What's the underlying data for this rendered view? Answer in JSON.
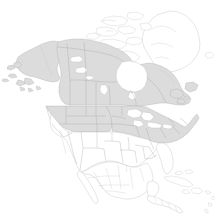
{
  "figure": {
    "kind": "choropleth-map",
    "width": 216,
    "height": 216,
    "background_color": "#ffffff"
  },
  "legend": {
    "filled_label": "Shaded region",
    "empty_label": "Unshaded region",
    "filled_color": "#dcdcdc",
    "empty_color": "#ffffff",
    "border_color": "#a9a9a9"
  },
  "map_data": {
    "projection": "lambert-conformal-conic",
    "extent": "North America, Greenland, Central America, Caribbean",
    "shaded_regions": [
      "Alaska",
      "Yukon",
      "Northwest Territories",
      "Nunavut",
      "British Columbia",
      "Alberta",
      "Saskatchewan",
      "Manitoba",
      "Ontario",
      "Quebec",
      "Newfoundland and Labrador",
      "New Brunswick",
      "Nova Scotia",
      "Prince Edward Island",
      "Washington",
      "Oregon",
      "Idaho",
      "Montana",
      "Wyoming",
      "North Dakota",
      "South Dakota",
      "Nebraska",
      "Minnesota",
      "Iowa",
      "Wisconsin",
      "Michigan",
      "Illinois",
      "Indiana",
      "Ohio",
      "Pennsylvania",
      "New York",
      "Vermont",
      "New Hampshire",
      "Maine",
      "Massachusetts",
      "Connecticut",
      "Rhode Island",
      "New Jersey",
      "West Virginia",
      "Maryland",
      "Delaware"
    ],
    "unshaded_regions": [
      "Greenland",
      "California",
      "Nevada",
      "Utah",
      "Arizona",
      "Colorado",
      "New Mexico",
      "Kansas",
      "Oklahoma",
      "Texas",
      "Missouri",
      "Arkansas",
      "Louisiana",
      "Mississippi",
      "Alabama",
      "Tennessee",
      "Kentucky",
      "Georgia",
      "Florida",
      "South Carolina",
      "North Carolina",
      "Virginia",
      "Mexico",
      "Guatemala",
      "Belize",
      "Honduras",
      "El Salvador",
      "Nicaragua",
      "Costa Rica",
      "Panama",
      "Cuba",
      "Bahamas",
      "Jamaica",
      "Haiti",
      "Dominican Republic",
      "Puerto Rico",
      "Iceland"
    ],
    "water_features": [
      "Great Lakes",
      "Great Bear Lake",
      "Great Slave Lake",
      "Lake Winnipeg",
      "Hudson Bay",
      "Gulf of Mexico",
      "Caribbean Sea",
      "Pacific Ocean",
      "Atlantic Ocean"
    ]
  }
}
